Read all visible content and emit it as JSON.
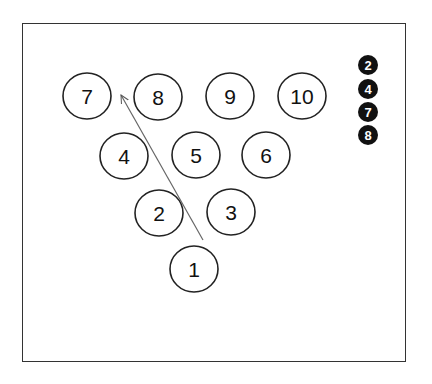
{
  "diagram": {
    "frame": {
      "x": 22,
      "y": 23,
      "width": 384,
      "height": 339
    },
    "pins": [
      {
        "label": "7",
        "cx": 87,
        "cy": 96
      },
      {
        "label": "8",
        "cx": 158,
        "cy": 97
      },
      {
        "label": "9",
        "cx": 230,
        "cy": 96
      },
      {
        "label": "10",
        "cx": 302,
        "cy": 96
      },
      {
        "label": "4",
        "cx": 124,
        "cy": 156
      },
      {
        "label": "5",
        "cx": 196,
        "cy": 155
      },
      {
        "label": "6",
        "cx": 266,
        "cy": 155
      },
      {
        "label": "2",
        "cx": 159,
        "cy": 213
      },
      {
        "label": "3",
        "cx": 231,
        "cy": 212
      },
      {
        "label": "1",
        "cx": 194,
        "cy": 269
      }
    ],
    "pin_radius": 24,
    "arrow": {
      "from": [
        203,
        240
      ],
      "to": [
        121,
        95
      ],
      "color": "#555555"
    },
    "legend": {
      "items": [
        {
          "label": "2",
          "cx": 368,
          "cy": 65
        },
        {
          "label": "4",
          "cx": 368,
          "cy": 89
        },
        {
          "label": "7",
          "cx": 368,
          "cy": 112
        },
        {
          "label": "8",
          "cx": 368,
          "cy": 135
        }
      ],
      "radius": 10,
      "fill": "#111111"
    }
  }
}
